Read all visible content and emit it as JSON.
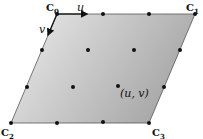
{
  "diagram": {
    "corners": [
      {
        "id": "C0",
        "label": "C",
        "sub": "0",
        "x": 57,
        "y": 14,
        "lx": 46,
        "ly": 11
      },
      {
        "id": "C1",
        "label": "C",
        "sub": "1",
        "x": 195,
        "y": 14,
        "lx": 186,
        "ly": 11
      },
      {
        "id": "C2",
        "label": "C",
        "sub": "2",
        "x": 11,
        "y": 123,
        "lx": 1,
        "ly": 136
      },
      {
        "id": "C3",
        "label": "C",
        "sub": "3",
        "x": 149,
        "y": 123,
        "lx": 152,
        "ly": 136
      }
    ],
    "u_label": "u",
    "v_label": "v",
    "point_label": "(u, v)",
    "dots": [
      [
        57,
        14
      ],
      [
        103,
        14
      ],
      [
        149,
        14
      ],
      [
        195,
        14
      ],
      [
        42,
        50
      ],
      [
        88,
        50
      ],
      [
        134,
        50
      ],
      [
        180,
        50
      ],
      [
        27,
        87
      ],
      [
        73,
        87
      ],
      [
        118,
        86
      ],
      [
        164,
        87
      ],
      [
        11,
        123
      ],
      [
        57,
        123
      ],
      [
        103,
        122
      ],
      [
        149,
        123
      ]
    ],
    "colors": {
      "fill_light": "#e9e9e9",
      "fill_dark": "#a9a9a9",
      "stroke": "#222222",
      "dot": "#111111"
    }
  }
}
